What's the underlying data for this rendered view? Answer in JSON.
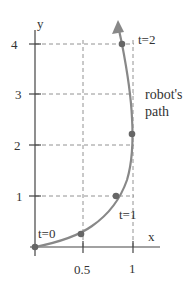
{
  "diagram": {
    "axis_x_label": "x",
    "axis_y_label": "y",
    "x_ticks": [
      "0.5",
      "1"
    ],
    "y_ticks": [
      "1",
      "2",
      "3",
      "4"
    ],
    "labels": {
      "t0": "t=0",
      "t1": "t=1",
      "t2": "t=2",
      "path_line1": "robot's",
      "path_line2": "path"
    },
    "colors": {
      "axis": "#444444",
      "grid": "#777777",
      "path": "#888888",
      "points": "#666666"
    }
  }
}
